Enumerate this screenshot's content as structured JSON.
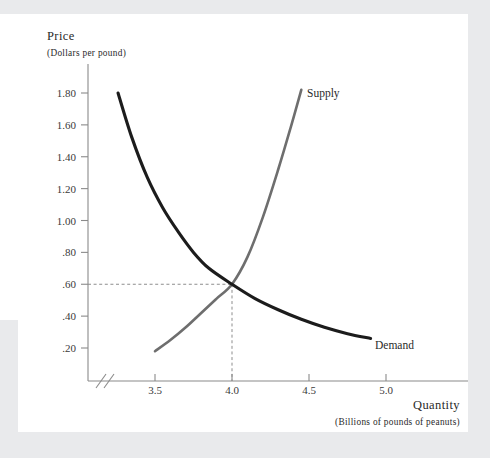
{
  "chart_data": {
    "type": "line",
    "title": "",
    "ylabel": "Price",
    "ylabel_units": "(Dollars per pound)",
    "xlabel": "Quantity",
    "xlabel_units": "(Billions of pounds of peanuts)",
    "xlim": [
      3.25,
      5.15
    ],
    "ylim": [
      0.0,
      1.9
    ],
    "x_ticks": [
      "3.5",
      "4.0",
      "4.5",
      "5.0"
    ],
    "x_tick_values": [
      3.5,
      4.0,
      4.5,
      5.0
    ],
    "y_ticks": [
      "1.80",
      "1.60",
      "1.40",
      "1.20",
      "1.00",
      ".80",
      ".60",
      ".40",
      ".20"
    ],
    "y_tick_values": [
      1.8,
      1.6,
      1.4,
      1.2,
      1.0,
      0.8,
      0.6,
      0.4,
      0.2
    ],
    "grid": false,
    "legend_position": "inline-curve-labels",
    "axis_break_x": true,
    "series": [
      {
        "name": "Supply",
        "label": "Supply",
        "color": "#6e6e6e",
        "width": 2.6,
        "points": [
          [
            3.5,
            0.18
          ],
          [
            3.6,
            0.25
          ],
          [
            3.7,
            0.33
          ],
          [
            3.8,
            0.42
          ],
          [
            3.9,
            0.51
          ],
          [
            4.0,
            0.6
          ],
          [
            4.1,
            0.77
          ],
          [
            4.2,
            1.02
          ],
          [
            4.3,
            1.32
          ],
          [
            4.38,
            1.58
          ],
          [
            4.45,
            1.82
          ]
        ]
      },
      {
        "name": "Demand",
        "label": "Demand",
        "color": "#1c1c1c",
        "width": 3.1,
        "points": [
          [
            3.26,
            1.8
          ],
          [
            3.35,
            1.52
          ],
          [
            3.45,
            1.27
          ],
          [
            3.55,
            1.08
          ],
          [
            3.65,
            0.93
          ],
          [
            3.75,
            0.8
          ],
          [
            3.85,
            0.7
          ],
          [
            4.0,
            0.6
          ],
          [
            4.15,
            0.51
          ],
          [
            4.3,
            0.44
          ],
          [
            4.45,
            0.38
          ],
          [
            4.6,
            0.33
          ],
          [
            4.75,
            0.29
          ],
          [
            4.9,
            0.26
          ]
        ]
      }
    ],
    "equilibrium": {
      "label": "",
      "quantity": 4.0,
      "price": 0.6,
      "guide_lines": true
    }
  },
  "colors": {
    "page_background": "#e9eaec",
    "card_background": "#ffffff",
    "axis": "#8a8a8a",
    "supply": "#6e6e6e",
    "demand": "#1c1c1c",
    "guide": "#8d8d8d",
    "text": "#2a2a2a"
  }
}
